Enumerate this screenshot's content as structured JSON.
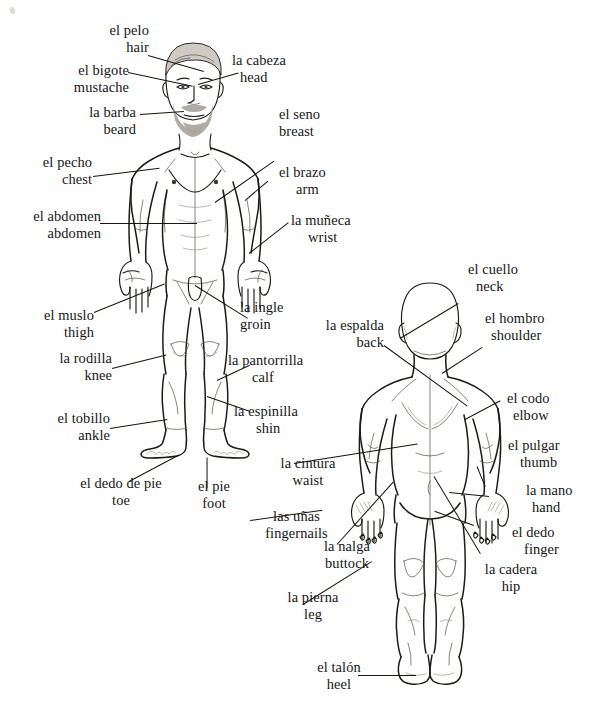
{
  "diagram": {
    "ink_color": "#1b1b17",
    "background_color": "#ffffff",
    "figures": [
      {
        "name": "front-view-male-figure",
        "view": "front"
      },
      {
        "name": "back-view-male-figure",
        "view": "back"
      }
    ]
  },
  "labels": {
    "hair": {
      "es": "el pelo",
      "en": "hair"
    },
    "head": {
      "es": "la cabeza",
      "en": "head"
    },
    "mustache": {
      "es": "el bigote",
      "en": "mustache"
    },
    "beard": {
      "es": "la barba",
      "en": "beard"
    },
    "breast": {
      "es": "el seno",
      "en": "breast"
    },
    "chest": {
      "es": "el pecho",
      "en": "chest"
    },
    "arm": {
      "es": "el brazo",
      "en": "arm"
    },
    "abdomen": {
      "es": "el abdomen",
      "en": "abdomen"
    },
    "wrist": {
      "es": "la muñeca",
      "en": "wrist"
    },
    "thigh": {
      "es": "el muslo",
      "en": "thigh"
    },
    "groin": {
      "es": "la ingle",
      "en": "groin"
    },
    "knee": {
      "es": "la rodilla",
      "en": "knee"
    },
    "calf": {
      "es": "la pantorrilla",
      "en": "calf"
    },
    "shin": {
      "es": "la espinilla",
      "en": "shin"
    },
    "ankle": {
      "es": "el tobillo",
      "en": "ankle"
    },
    "toe": {
      "es": "el dedo de pie",
      "en": "toe"
    },
    "foot": {
      "es": "el pie",
      "en": "foot"
    },
    "neck": {
      "es": "el cuello",
      "en": "neck"
    },
    "back": {
      "es": "la espalda",
      "en": "back"
    },
    "shoulder": {
      "es": "el hombro",
      "en": "shoulder"
    },
    "elbow": {
      "es": "el codo",
      "en": "elbow"
    },
    "thumb": {
      "es": "el pulgar",
      "en": "thumb"
    },
    "waist": {
      "es": "la cintura",
      "en": "waist"
    },
    "hand": {
      "es": "la mano",
      "en": "hand"
    },
    "fingernails": {
      "es": "las uñas",
      "en": "fingernails"
    },
    "finger": {
      "es": "el dedo",
      "en": "finger"
    },
    "buttock": {
      "es": "la nalga",
      "en": "buttock"
    },
    "hip": {
      "es": "la cadera",
      "en": "hip"
    },
    "leg": {
      "es": "la pierna",
      "en": "leg"
    },
    "heel": {
      "es": "el talón",
      "en": "heel"
    }
  }
}
